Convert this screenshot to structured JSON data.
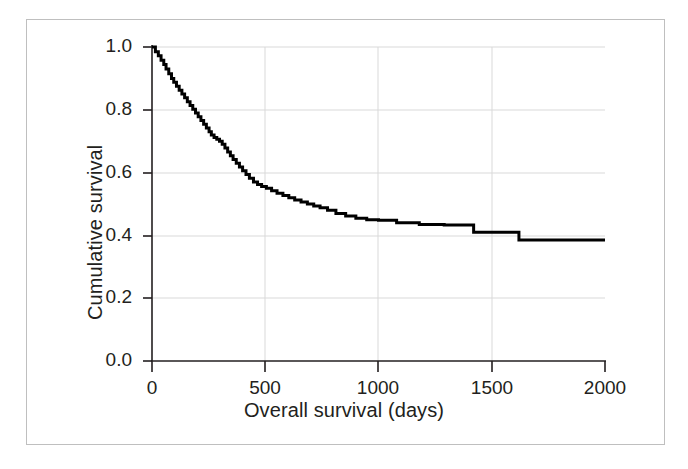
{
  "figure": {
    "frame_border_color": "#bfbfbf",
    "background_color": "#ffffff",
    "curve_color": "#000000",
    "grid_color": "#d9d9d9",
    "axis_color": "#231f20"
  },
  "chart_data": {
    "type": "line",
    "title": "",
    "subtitle": "",
    "xlabel": "Overall survival (days)",
    "ylabel": "Cumulative survival",
    "xlim": [
      0,
      2000
    ],
    "ylim": [
      0.0,
      1.0
    ],
    "xticks": [
      0,
      500,
      1000,
      1500,
      2000
    ],
    "xtick_labels": [
      "0",
      "500",
      "1000",
      "1500",
      "2000"
    ],
    "yticks": [
      0.0,
      0.2,
      0.4,
      0.6,
      0.8,
      1.0
    ],
    "ytick_labels": [
      "0.0",
      "0.2",
      "0.4",
      "0.6",
      "0.8",
      "1.0"
    ],
    "grid": true,
    "grid_axis": "both",
    "legend": null,
    "legend_position": "none",
    "annotations": [],
    "series": [
      {
        "name": "Cumulative survival",
        "style": "step-post",
        "color": "#000000",
        "line_width": 3,
        "x": [
          0,
          15,
          28,
          40,
          52,
          62,
          74,
          86,
          96,
          108,
          120,
          132,
          144,
          156,
          168,
          180,
          192,
          204,
          216,
          228,
          240,
          252,
          262,
          274,
          286,
          298,
          310,
          322,
          334,
          346,
          358,
          372,
          386,
          400,
          415,
          430,
          448,
          466,
          484,
          505,
          528,
          552,
          578,
          604,
          630,
          658,
          686,
          714,
          742,
          775,
          812,
          855,
          900,
          948,
          1000,
          1080,
          1180,
          1290,
          1395,
          1420,
          1490,
          1620,
          1800,
          2000
        ],
        "y": [
          1.0,
          0.985,
          0.972,
          0.958,
          0.944,
          0.93,
          0.915,
          0.9,
          0.888,
          0.875,
          0.862,
          0.85,
          0.838,
          0.826,
          0.814,
          0.802,
          0.79,
          0.778,
          0.766,
          0.754,
          0.742,
          0.73,
          0.72,
          0.712,
          0.706,
          0.7,
          0.69,
          0.678,
          0.666,
          0.654,
          0.642,
          0.63,
          0.618,
          0.606,
          0.594,
          0.582,
          0.57,
          0.562,
          0.556,
          0.55,
          0.542,
          0.534,
          0.527,
          0.52,
          0.513,
          0.506,
          0.5,
          0.494,
          0.488,
          0.48,
          0.47,
          0.462,
          0.455,
          0.45,
          0.448,
          0.44,
          0.435,
          0.433,
          0.433,
          0.41,
          0.41,
          0.385,
          0.385,
          0.385
        ]
      }
    ]
  }
}
